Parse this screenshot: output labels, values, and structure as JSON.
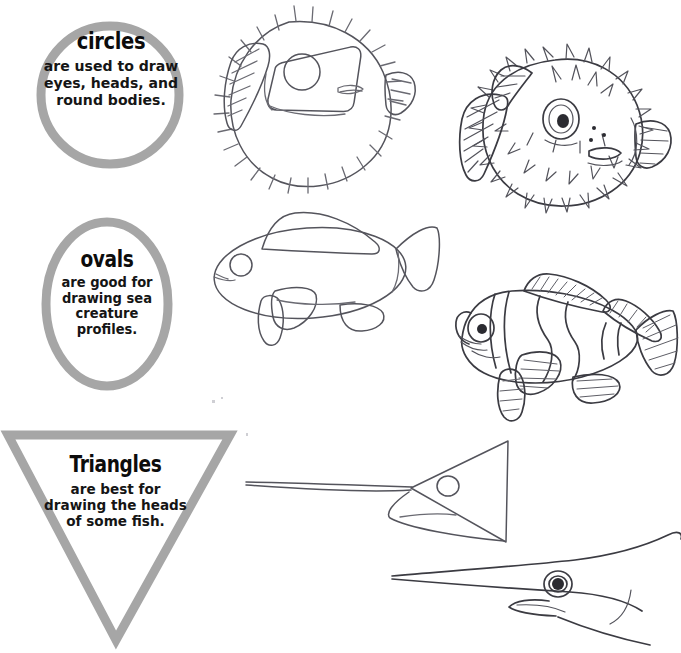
{
  "page": {
    "background_color": "#ffffff",
    "shape_outline_color": "#a6a6a6",
    "ink_color": "#3b3b42",
    "text_color": "#0c0c0c"
  },
  "callouts": [
    {
      "id": "circles",
      "shape": "circle",
      "heading": "circles",
      "body": "are used to draw eyes, heads, and round bodies."
    },
    {
      "id": "ovals",
      "shape": "oval",
      "heading": "ovals",
      "body": "are good for drawing sea creature profiles."
    },
    {
      "id": "triangles",
      "shape": "triangle",
      "heading": "Triangles",
      "body": "are best for drawing the heads of some fish."
    }
  ],
  "illustrations": [
    {
      "id": "puffer-sketch",
      "subject": "pufferfish",
      "stage": "construction sketch",
      "base_shapes": [
        "circle",
        "rectangle",
        "circle"
      ],
      "row": "circles"
    },
    {
      "id": "puffer-final",
      "subject": "pufferfish",
      "stage": "finished drawing",
      "base_shapes": [
        "circle"
      ],
      "row": "circles"
    },
    {
      "id": "clownfish-sketch",
      "subject": "clownfish",
      "stage": "construction sketch",
      "base_shapes": [
        "oval"
      ],
      "row": "ovals"
    },
    {
      "id": "clownfish-final",
      "subject": "clownfish",
      "stage": "finished drawing",
      "base_shapes": [
        "oval"
      ],
      "row": "ovals"
    },
    {
      "id": "ray-sketch",
      "subject": "stingray",
      "stage": "construction sketch",
      "base_shapes": [
        "triangle",
        "circle"
      ],
      "row": "triangles"
    },
    {
      "id": "ray-final",
      "subject": "stingray",
      "stage": "finished drawing",
      "base_shapes": [
        "triangle"
      ],
      "row": "triangles"
    }
  ]
}
